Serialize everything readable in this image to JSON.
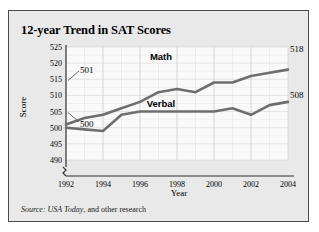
{
  "figure": {
    "title": "12-year Trend in SAT Scores",
    "source_lead": "Source:",
    "source_publication": "USA Today",
    "source_rest": ", and other research",
    "panel_background": "#e9e9e9",
    "border_color": "#4a4a4a",
    "line_color": "#6e6e6e",
    "text_color": "#000000"
  },
  "chart_data": {
    "type": "line",
    "title": "12-year Trend in SAT Scores",
    "xlabel": "Year",
    "ylabel": "Score",
    "grid": true,
    "legend": "inline-series-labels",
    "xlim": [
      1992,
      2004
    ],
    "ylim": [
      490,
      525
    ],
    "ytick_labels": [
      "490",
      "495",
      "500",
      "505",
      "510",
      "515",
      "520",
      "525"
    ],
    "yticks": [
      490,
      495,
      500,
      505,
      510,
      515,
      520,
      525
    ],
    "xtick_labels": [
      "1992",
      "1994",
      "1996",
      "1998",
      "2000",
      "2002",
      "2004"
    ],
    "xticks": [
      1992,
      1994,
      1996,
      1998,
      2000,
      2002,
      2004
    ],
    "x": [
      1992,
      1993,
      1994,
      1995,
      1996,
      1997,
      1998,
      1999,
      2000,
      2001,
      2002,
      2003,
      2004
    ],
    "series": [
      {
        "name": "Math",
        "label": "Math",
        "values": [
          501,
          503,
          504,
          506,
          508,
          511,
          512,
          511,
          514,
          514,
          516,
          517,
          518
        ],
        "start_label": "501",
        "end_label": "518"
      },
      {
        "name": "Verbal",
        "label": "Verbal",
        "values": [
          500,
          499.5,
          499,
          504,
          505,
          505,
          505,
          505,
          505,
          506,
          504,
          507,
          508
        ],
        "start_label": "500",
        "end_label": "508"
      }
    ],
    "annotations": [
      {
        "text": "501",
        "series": "Math",
        "at_year": 1992,
        "value": 501
      },
      {
        "text": "500",
        "series": "Verbal",
        "at_year": 1992,
        "value": 500
      },
      {
        "text": "518",
        "series": "Math",
        "at_year": 2004,
        "value": 518
      },
      {
        "text": "508",
        "series": "Verbal",
        "at_year": 2004,
        "value": 508
      }
    ]
  }
}
